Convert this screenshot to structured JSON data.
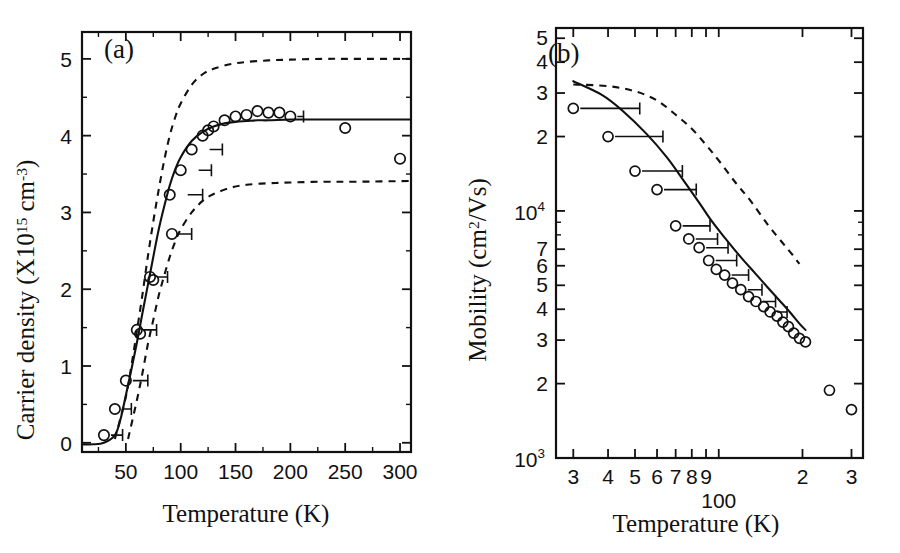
{
  "figure": {
    "background": "#ffffff",
    "ink_color": "#111111",
    "panels": [
      "a",
      "b"
    ]
  },
  "panel_a": {
    "tag": "(a)",
    "xlabel": "Temperature (K)",
    "ylabel_main": "Carrier density (X10",
    "ylabel_exp1": "15",
    "ylabel_mid": " cm",
    "ylabel_exp2": "-3",
    "ylabel_close": ")",
    "ylabel_full": "Carrier density (X10^15 cm^-3)",
    "x_ticklabels": [
      "50",
      "100",
      "150",
      "200",
      "250",
      "300"
    ],
    "x_tickvalues": [
      50,
      100,
      150,
      200,
      250,
      300
    ],
    "y_ticklabels": [
      "0",
      "1",
      "2",
      "3",
      "4",
      "5"
    ],
    "y_tickvalues": [
      0,
      1,
      2,
      3,
      4,
      5
    ]
  },
  "panel_b": {
    "tag": "(b)",
    "xlabel": "Temperature (K)",
    "ylabel_main": "Mobility (cm",
    "ylabel_exp": "2",
    "ylabel_tail": "/Vs)",
    "ylabel_full": "Mobility (cm^2/Vs)",
    "x_ticklabels": [
      "3",
      "4",
      "5",
      "6",
      "7",
      "8",
      "9",
      "100",
      "2",
      "3"
    ],
    "x_tickvalues": [
      30,
      40,
      50,
      60,
      70,
      80,
      90,
      100,
      200,
      300
    ],
    "y_ticklabels": [
      "10^3",
      "2",
      "3",
      "4",
      "5",
      "6",
      "7",
      "10^4",
      "2",
      "3",
      "4",
      "5"
    ],
    "y_tickvalues": [
      1000,
      2000,
      3000,
      4000,
      5000,
      6000,
      7000,
      10000,
      20000,
      30000,
      40000,
      50000
    ]
  },
  "chart_data": [
    {
      "type": "scatter",
      "panel": "a",
      "title": "(a) Carrier density vs Temperature",
      "xlabel": "Temperature (K)",
      "ylabel": "Carrier density (X10^15 cm^-3)",
      "xlim": [
        10,
        310
      ],
      "ylim": [
        -0.12,
        5.35
      ],
      "xscale": "linear",
      "yscale": "linear",
      "grid": false,
      "legend": "none",
      "series": [
        {
          "name": "measured carrier density",
          "style": "open-circles",
          "x": [
            30,
            40,
            50,
            60,
            63,
            72,
            75,
            90,
            92,
            100,
            110,
            120,
            125,
            130,
            140,
            150,
            160,
            170,
            180,
            190,
            200,
            250,
            300
          ],
          "y": [
            0.1,
            0.44,
            0.81,
            1.47,
            1.42,
            2.16,
            2.12,
            3.23,
            2.72,
            3.55,
            3.82,
            4.0,
            4.07,
            4.12,
            4.2,
            4.25,
            4.27,
            4.32,
            4.3,
            4.3,
            4.25,
            4.1,
            3.7
          ]
        },
        {
          "name": "fit (solid)",
          "style": "solid-line",
          "x": [
            10,
            20,
            30,
            40,
            45,
            50,
            55,
            60,
            65,
            70,
            75,
            80,
            85,
            90,
            95,
            100,
            110,
            120,
            130,
            140,
            150,
            160,
            170,
            180,
            200,
            220,
            250,
            280,
            310
          ],
          "y": [
            -0.02,
            -0.02,
            0.0,
            0.1,
            0.3,
            0.62,
            0.95,
            1.3,
            1.68,
            2.05,
            2.42,
            2.78,
            3.08,
            3.35,
            3.56,
            3.72,
            3.93,
            4.05,
            4.12,
            4.16,
            4.18,
            4.19,
            4.2,
            4.2,
            4.21,
            4.21,
            4.21,
            4.21,
            4.21
          ]
        },
        {
          "name": "upper bound (dashed)",
          "style": "dashed-line",
          "x": [
            40,
            50,
            55,
            60,
            65,
            70,
            75,
            80,
            85,
            90,
            95,
            100,
            110,
            120,
            130,
            145,
            160,
            180,
            200,
            230,
            260,
            310
          ],
          "y": [
            0.05,
            0.6,
            1.0,
            1.45,
            1.92,
            2.42,
            2.88,
            3.3,
            3.68,
            4.0,
            4.24,
            4.42,
            4.66,
            4.8,
            4.87,
            4.93,
            4.96,
            4.98,
            4.99,
            5.0,
            5.0,
            5.0
          ]
        },
        {
          "name": "lower bound (dashed)",
          "style": "dashed-line",
          "x": [
            52,
            60,
            65,
            70,
            75,
            80,
            85,
            90,
            95,
            100,
            110,
            120,
            130,
            145,
            160,
            180,
            200,
            230,
            260,
            310
          ],
          "y": [
            0.05,
            0.55,
            0.9,
            1.28,
            1.6,
            1.92,
            2.18,
            2.42,
            2.62,
            2.78,
            3.0,
            3.15,
            3.24,
            3.32,
            3.36,
            3.38,
            3.39,
            3.4,
            3.4,
            3.41
          ]
        }
      ],
      "error_bars": {
        "orientation": "horizontal-right",
        "points": [
          {
            "x": 30,
            "y": 0.1,
            "x_hi": 47
          },
          {
            "x": 40,
            "y": 0.44,
            "x_hi": 55
          },
          {
            "x": 50,
            "y": 0.81,
            "x_hi": 70
          },
          {
            "x": 60,
            "y": 1.47,
            "x_hi": 78
          },
          {
            "x": 72,
            "y": 2.16,
            "x_hi": 88
          },
          {
            "x": 90,
            "y": 2.72,
            "x_hi": 110
          },
          {
            "x": 100,
            "y": 3.23,
            "x_hi": 120
          },
          {
            "x": 110,
            "y": 3.55,
            "x_hi": 128
          },
          {
            "x": 120,
            "y": 3.82,
            "x_hi": 138
          },
          {
            "x": 200,
            "y": 4.25,
            "x_hi": 212
          }
        ]
      }
    },
    {
      "type": "scatter",
      "panel": "b",
      "title": "(b) Mobility vs Temperature",
      "xlabel": "Temperature (K)",
      "ylabel": "Mobility (cm^2/Vs)",
      "xlim": [
        26,
        330
      ],
      "ylim": [
        1000,
        55000
      ],
      "xscale": "log",
      "yscale": "log",
      "grid": false,
      "legend": "none",
      "series": [
        {
          "name": "measured mobility",
          "style": "open-circles",
          "x": [
            30,
            40,
            50,
            60,
            70,
            78,
            85,
            92,
            98,
            105,
            112,
            120,
            128,
            136,
            145,
            153,
            162,
            170,
            178,
            186,
            195,
            205,
            250,
            300
          ],
          "y": [
            26000,
            20000,
            14500,
            12200,
            8700,
            7700,
            7100,
            6300,
            5800,
            5500,
            5100,
            4800,
            4500,
            4300,
            4100,
            3900,
            3750,
            3550,
            3400,
            3200,
            3050,
            2950,
            1880,
            1570
          ]
        },
        {
          "name": "fit (solid)",
          "style": "solid-line",
          "x": [
            30,
            38,
            45,
            55,
            65,
            75,
            85,
            95,
            105,
            120,
            135,
            150,
            165,
            180,
            195,
            205
          ],
          "y": [
            33500,
            29500,
            25500,
            20500,
            16500,
            13200,
            10800,
            9000,
            7800,
            6500,
            5600,
            4900,
            4350,
            3900,
            3500,
            3300
          ]
        },
        {
          "name": "upper bound (dashed)",
          "style": "dashed-line",
          "x": [
            30,
            40,
            50,
            60,
            70,
            80,
            90,
            100,
            115,
            130,
            150,
            170,
            185,
            195
          ],
          "y": [
            32500,
            32000,
            30500,
            28000,
            24500,
            21500,
            18500,
            16000,
            13000,
            11000,
            8800,
            7400,
            6600,
            6100
          ]
        }
      ],
      "error_bars": {
        "orientation": "horizontal-right",
        "points": [
          {
            "x": 30,
            "y": 26000,
            "x_hi": 52
          },
          {
            "x": 40,
            "y": 20000,
            "x_hi": 63
          },
          {
            "x": 50,
            "y": 14500,
            "x_hi": 74
          },
          {
            "x": 60,
            "y": 12200,
            "x_hi": 83
          },
          {
            "x": 70,
            "y": 8700,
            "x_hi": 93
          },
          {
            "x": 78,
            "y": 7700,
            "x_hi": 99
          },
          {
            "x": 85,
            "y": 7100,
            "x_hi": 108
          },
          {
            "x": 92,
            "y": 6300,
            "x_hi": 116
          },
          {
            "x": 105,
            "y": 5500,
            "x_hi": 128
          },
          {
            "x": 120,
            "y": 4800,
            "x_hi": 143
          },
          {
            "x": 136,
            "y": 4300,
            "x_hi": 160
          },
          {
            "x": 153,
            "y": 3900,
            "x_hi": 176
          }
        ]
      }
    }
  ]
}
